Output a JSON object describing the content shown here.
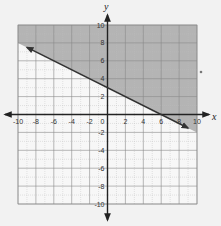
{
  "chart_data": {
    "type": "line",
    "title": "",
    "xlabel": "x",
    "ylabel": "y",
    "xlim": [
      -10,
      10
    ],
    "ylim": [
      -10,
      10
    ],
    "grid": true,
    "grid_minor_step": 1,
    "x_ticks": [
      -10,
      -8,
      -6,
      -4,
      -2,
      0,
      2,
      4,
      6,
      8,
      10
    ],
    "y_ticks": [
      -10,
      -8,
      -6,
      -4,
      -2,
      2,
      4,
      6,
      8,
      10
    ],
    "x_tick_labels": [
      "-10",
      "-8",
      "-6",
      "-4",
      "-2",
      "0",
      "2",
      "4",
      "6",
      "8",
      "10"
    ],
    "y_tick_labels": [
      "-10",
      "-8",
      "-6",
      "-4",
      "-2",
      "2",
      "4",
      "6",
      "8",
      "10"
    ],
    "series": [
      {
        "name": "boundary line",
        "equation": "y = -1/2 x + 3",
        "style": "solid",
        "arrows": "both",
        "x": [
          -9,
          0,
          6,
          9
        ],
        "y": [
          7.5,
          3,
          0,
          -1.5
        ]
      }
    ],
    "shaded_region": {
      "description": "region above the line",
      "inequality": "y >= -1/2 x + 3",
      "color": "#9a9a9a"
    }
  },
  "colors": {
    "background": "#f2f2f2",
    "grid_minor": "#bdbdbd",
    "grid_major": "#8a8a8a",
    "shade": "#a8a8a8",
    "axis": "#222222",
    "line": "#333333"
  }
}
